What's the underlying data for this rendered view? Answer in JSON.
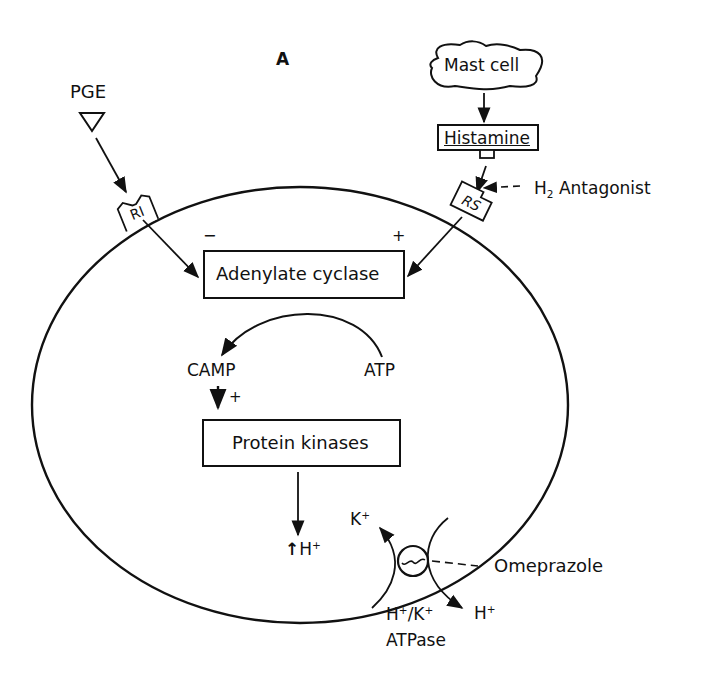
{
  "figure": {
    "panel_label": "A",
    "stroke_color": "#111111",
    "background": "#ffffff"
  },
  "external": {
    "pge": {
      "label": "PGE",
      "symbol": "down-triangle"
    },
    "mast_cell": {
      "label": "Mast cell"
    },
    "histamine": {
      "label": "Histamine"
    },
    "h2_antagonist": {
      "label": "Antagonist",
      "prefix": "H",
      "subscript": "2"
    },
    "omeprazole": {
      "label": "Omeprazole"
    }
  },
  "receptors": {
    "ri": {
      "label": "RI",
      "sign": "−"
    },
    "rs": {
      "label": "RS",
      "sign": "+"
    }
  },
  "cell": {
    "adenylate_cyclase": {
      "label": "Adenylate cyclase"
    },
    "camp": {
      "label": "CAMP"
    },
    "atp": {
      "label": "ATP"
    },
    "camp_sign": "+",
    "protein_kinases": {
      "label": "Protein kinases"
    },
    "h_increase": {
      "arrow": "↑",
      "label": "H",
      "sup": "+"
    }
  },
  "pump": {
    "k_in": {
      "label": "K",
      "sup": "+"
    },
    "h_out": {
      "label": "H",
      "sup": "+"
    },
    "name_line1": {
      "h": "H",
      "h_sup": "+",
      "slash": "/",
      "k": "K",
      "k_sup": "+"
    },
    "name_line2": "ATPase"
  }
}
